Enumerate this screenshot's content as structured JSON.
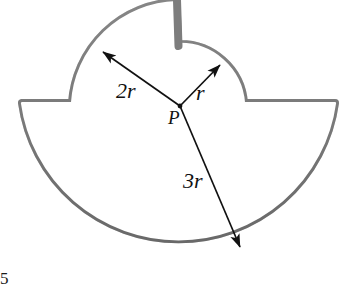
{
  "figure": {
    "point_label": "P",
    "labels": {
      "large_radius": "2r",
      "small_radius": "r",
      "semicircle_radius": "3r"
    },
    "corner_mark": "5",
    "colors": {
      "outline_band": "#8d8d8d",
      "outline_edge": "#5e5e5e",
      "interior": "#ffffff",
      "arrow": "#111111",
      "text": "#111111",
      "background": "#ffffff"
    },
    "geometry": {
      "center": {
        "x": 180,
        "y": 106
      },
      "semicircle_radius_px": 158,
      "large_arc_radius_px": 108,
      "small_arc_radius_px": 64,
      "band_thickness_px": 7
    },
    "arrows": [
      {
        "name": "arrow-2r",
        "from": {
          "x": 180,
          "y": 106
        },
        "to": {
          "x": 101,
          "y": 50
        },
        "label": "2r"
      },
      {
        "name": "arrow-r",
        "from": {
          "x": 180,
          "y": 106
        },
        "to": {
          "x": 222,
          "y": 63
        },
        "label": "r"
      },
      {
        "name": "arrow-3r",
        "from": {
          "x": 180,
          "y": 106
        },
        "to": {
          "x": 241,
          "y": 250
        },
        "label": "3r"
      }
    ]
  }
}
